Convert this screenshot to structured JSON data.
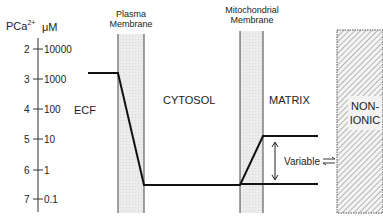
{
  "axis": {
    "left_label": "PCa",
    "left_label_sup": "2+",
    "right_label": "μM",
    "ticks": [
      {
        "pca": "2",
        "um": "10000"
      },
      {
        "pca": "3",
        "um": "1000"
      },
      {
        "pca": "4",
        "um": "100"
      },
      {
        "pca": "5",
        "um": "10"
      },
      {
        "pca": "6",
        "um": "1"
      },
      {
        "pca": "7",
        "um": "0.1"
      }
    ]
  },
  "membranes": {
    "plasma": {
      "line1": "Plasma",
      "line2": "Membrane"
    },
    "mito": {
      "line1": "Mitochondrial",
      "line2": "Membrane"
    }
  },
  "compartments": {
    "ecf": "ECF",
    "cytosol": "CYTOSOL",
    "matrix": "MATRIX",
    "nonionic_line1": "NON-",
    "nonionic_line2": "IONIC"
  },
  "annotations": {
    "variable": "Variable"
  },
  "profile": {
    "ecf_pca": 3,
    "cytosol_pca": 7,
    "matrix_pca_range": [
      5,
      7
    ]
  }
}
